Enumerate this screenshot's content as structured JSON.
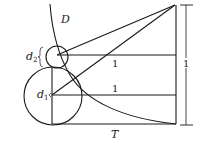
{
  "diagram": {
    "labels": {
      "curve": "D",
      "small_circle": "d",
      "small_circle_sub": "2",
      "large_circle": "d",
      "large_circle_sub": "1",
      "bottom_line": "T",
      "upper_horizontal": "1",
      "lower_horizontal": "1",
      "height_dimension": "1"
    },
    "colors": {
      "stroke": "#1a1a1a",
      "background": "#ffffff"
    }
  }
}
